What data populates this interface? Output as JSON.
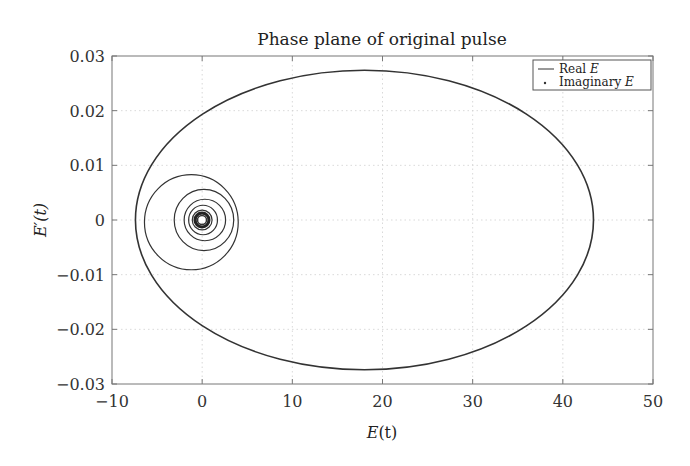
{
  "chart_data": {
    "type": "line",
    "title": "Phase plane of original pulse",
    "xlabel": "E(t)",
    "ylabel": "E'(t)",
    "xlim": [
      -10,
      50
    ],
    "ylim": [
      -0.03,
      0.03
    ],
    "xticks": [
      -10,
      0,
      10,
      20,
      30,
      40,
      50
    ],
    "xtick_labels": [
      "−10",
      "0",
      "10",
      "20",
      "30",
      "40",
      "50"
    ],
    "yticks": [
      0.03,
      0.02,
      0.01,
      0,
      -0.01,
      -0.02,
      -0.03
    ],
    "ytick_labels": [
      "0.03",
      "0.02",
      "0.01",
      "0",
      "−0.01",
      "−0.02",
      "−0.03"
    ],
    "grid": true,
    "legend_position": "upper right",
    "legend": [
      {
        "label": "Real E",
        "marker": "line"
      },
      {
        "label": "Imaginary E",
        "marker": "dot"
      }
    ],
    "series": [
      {
        "name": "Real E",
        "description": "Phase-plane trajectory: large loop plus shrinking loops spiralling toward origin",
        "loops": [
          {
            "cx": 18.0,
            "cy": 0.0,
            "rx": 25.4,
            "ry": 0.0274
          },
          {
            "cx": -1.2,
            "cy": -0.0004,
            "rx": 5.2,
            "ry": 0.0087
          },
          {
            "cx": 0.2,
            "cy": 0.0,
            "rx": 3.3,
            "ry": 0.0056
          },
          {
            "cx": 0.3,
            "cy": 0.0,
            "rx": 2.3,
            "ry": 0.0038
          },
          {
            "cx": 0.1,
            "cy": 0.0,
            "rx": 1.6,
            "ry": 0.0027
          },
          {
            "cx": 0.0,
            "cy": 0.0,
            "rx": 1.1,
            "ry": 0.0018
          },
          {
            "cx": 0.0,
            "cy": 0.0,
            "rx": 0.7,
            "ry": 0.0012
          }
        ]
      },
      {
        "name": "Imaginary E",
        "description": "Negligible; coincides with origin"
      }
    ]
  },
  "labels": {
    "title": "Phase plane of original pulse",
    "xlabel_main": "E",
    "xlabel_arg": "(t)",
    "ylabel": "E′(t)",
    "legend_real": "Real ",
    "legend_real_var": "E",
    "legend_imag": "Imaginary ",
    "legend_imag_var": "E"
  }
}
